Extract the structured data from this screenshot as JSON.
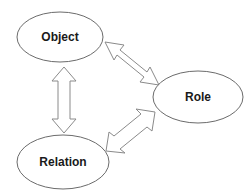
{
  "diagram": {
    "background_color": "#ffffff",
    "node_fill_color": "#ffffff",
    "node_stroke_color": "#6b6b6b",
    "arrow_fill_color": "#ffffff",
    "arrow_stroke_color": "#8a8a8a",
    "label_color": "#1a1a1a",
    "nodes": [
      {
        "id": "object",
        "label": "Object",
        "cx": 60,
        "cy": 37,
        "rx": 43,
        "ry": 25
      },
      {
        "id": "role",
        "label": "Role",
        "cx": 198,
        "cy": 97,
        "rx": 45,
        "ry": 26
      },
      {
        "id": "relation",
        "label": "Relation",
        "cx": 63,
        "cy": 162,
        "rx": 46,
        "ry": 27
      }
    ],
    "connectors": [
      {
        "id": "object-relation",
        "from": "object",
        "to": "relation",
        "style": "double-headed-block-arrow",
        "orientation": "vertical"
      },
      {
        "id": "object-role",
        "from": "object",
        "to": "role",
        "style": "double-headed-block-arrow",
        "orientation": "diagonal-down-right"
      },
      {
        "id": "relation-role",
        "from": "relation",
        "to": "role",
        "style": "double-headed-block-arrow",
        "orientation": "diagonal-up-right"
      }
    ]
  }
}
